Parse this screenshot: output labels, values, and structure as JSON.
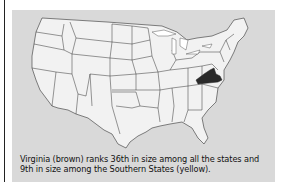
{
  "figure": {
    "caption_line1": "Virginia (brown) ranks 36th in size among all the states and",
    "caption_line2": "9th in size among the Southern States (yellow).",
    "highlighted_state": "Virginia",
    "colors": {
      "panel_bg": "#d9d9d9",
      "state_fill": "#f2f2f2",
      "state_border": "#333333",
      "highlight_fill": "#2a2a2a",
      "lakes": "#ffffff"
    }
  }
}
